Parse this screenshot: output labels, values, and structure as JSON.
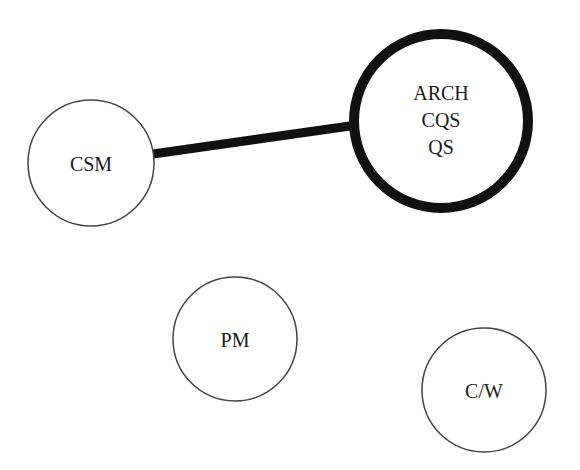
{
  "diagram": {
    "nodes": [
      {
        "id": "csm",
        "label_lines": [
          "CSM"
        ],
        "emphasis": "normal"
      },
      {
        "id": "arch_group",
        "label_lines": [
          "ARCH",
          "CQS",
          "QS"
        ],
        "emphasis": "bold"
      },
      {
        "id": "pm",
        "label_lines": [
          "PM"
        ],
        "emphasis": "normal"
      },
      {
        "id": "cw",
        "label_lines": [
          "C/W"
        ],
        "emphasis": "normal"
      }
    ],
    "edges": [
      {
        "from": "csm",
        "to": "arch_group",
        "style": "heavy"
      }
    ],
    "colors": {
      "stroke": "#111111",
      "fill": "#ffffff",
      "thin_stroke": "#444444"
    }
  }
}
